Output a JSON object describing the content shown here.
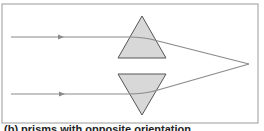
{
  "figure": {
    "caption": "(b) prisms with opposite orientation",
    "colors": {
      "frame": "#9a9a9a",
      "ray": "#8a8a8a",
      "prism_fill": "#d8d8d8",
      "prism_stroke": "#555555"
    },
    "elements": {
      "top_prism": "upward-pointing triangle",
      "bottom_prism": "downward-pointing triangle",
      "rays": [
        "upper incident ray",
        "lower incident ray"
      ],
      "focal_point": "rays converge on right"
    }
  }
}
